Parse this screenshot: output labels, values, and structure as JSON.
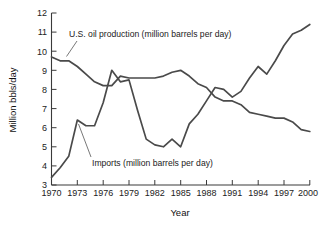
{
  "chart_data": {
    "type": "line",
    "title": "",
    "subtitle": "",
    "xlabel": "Year",
    "ylabel": "Million bbls/day",
    "xlim": [
      1970,
      2000
    ],
    "ylim": [
      3,
      12
    ],
    "xticks": [
      "1970",
      "1973",
      "1976",
      "1979",
      "1982",
      "1985",
      "1988",
      "1991",
      "1994",
      "1997",
      "2000"
    ],
    "yticks": [
      "3",
      "4",
      "5",
      "6",
      "7",
      "8",
      "9",
      "10",
      "11",
      "12"
    ],
    "grid": false,
    "legend_position": "inline-annotations",
    "annotations": [
      {
        "name": "production-annotation",
        "text": "U.S. oil production (million barrels per day)"
      },
      {
        "name": "imports-annotation",
        "text": "Imports (million barrels per day)"
      }
    ],
    "x": [
      1970,
      1971,
      1972,
      1973,
      1974,
      1975,
      1976,
      1977,
      1978,
      1979,
      1980,
      1981,
      1982,
      1983,
      1984,
      1985,
      1986,
      1987,
      1988,
      1989,
      1990,
      1991,
      1992,
      1993,
      1994,
      1995,
      1996,
      1997,
      1998,
      1999,
      2000
    ],
    "series": [
      {
        "name": "U.S. oil production (million barrels per day)",
        "color": "#4a4a4a",
        "values": [
          9.7,
          9.5,
          9.5,
          9.2,
          8.8,
          8.4,
          8.2,
          8.2,
          8.7,
          8.6,
          8.6,
          8.6,
          8.6,
          8.7,
          8.9,
          9.0,
          8.7,
          8.3,
          8.1,
          7.6,
          7.4,
          7.4,
          7.2,
          6.8,
          6.7,
          6.6,
          6.5,
          6.5,
          6.3,
          5.9,
          5.8
        ]
      },
      {
        "name": "Imports (million barrels per day)",
        "color": "#4a4a4a",
        "values": [
          3.4,
          3.9,
          4.5,
          6.4,
          6.1,
          6.1,
          7.3,
          9.0,
          8.4,
          8.5,
          6.9,
          5.4,
          5.1,
          5.0,
          5.4,
          5.0,
          6.2,
          6.7,
          7.4,
          8.1,
          8.0,
          7.6,
          7.9,
          8.6,
          9.2,
          8.8,
          9.5,
          10.3,
          10.9,
          11.1,
          11.4
        ]
      }
    ]
  },
  "axes": {
    "y_title": "Million bbls/day",
    "x_title": "Year"
  }
}
